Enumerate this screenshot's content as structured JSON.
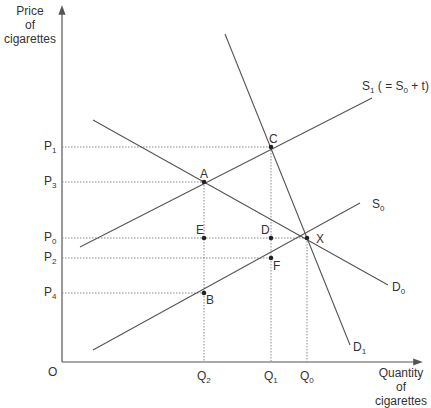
{
  "axes": {
    "y_title": [
      "Price",
      "of",
      "cigarettes"
    ],
    "x_title": [
      "Quantity",
      "of",
      "cigarettes"
    ],
    "origin": "O"
  },
  "price_labels": [
    {
      "id": "P1",
      "base": "P",
      "sub": "1"
    },
    {
      "id": "P3",
      "base": "P",
      "sub": "3"
    },
    {
      "id": "P0",
      "base": "P",
      "sub": "0"
    },
    {
      "id": "P2",
      "base": "P",
      "sub": "2"
    },
    {
      "id": "P4",
      "base": "P",
      "sub": "4"
    }
  ],
  "quantity_labels": [
    {
      "id": "Q2",
      "base": "Q",
      "sub": "2"
    },
    {
      "id": "Q1",
      "base": "Q",
      "sub": "1"
    },
    {
      "id": "Q0",
      "base": "Q",
      "sub": "0"
    }
  ],
  "curves": {
    "S1": {
      "base": "S",
      "sub": "1",
      "suffix": " ( = S",
      "suffix_sub": "0",
      "suffix_end": " + t)"
    },
    "S0": {
      "base": "S",
      "sub": "0"
    },
    "D0": {
      "base": "D",
      "sub": "0"
    },
    "D1": {
      "base": "D",
      "sub": "1"
    }
  },
  "points": [
    "A",
    "B",
    "C",
    "D",
    "E",
    "F",
    "X"
  ],
  "colors": {
    "line": "#555555",
    "dotted": "#888888",
    "point": "#222222"
  }
}
